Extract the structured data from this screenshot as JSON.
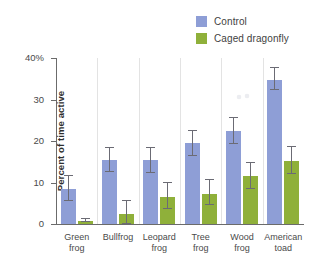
{
  "chart_data": {
    "type": "bar",
    "title": "",
    "xlabel": "",
    "ylabel": "Percent of time active",
    "ylim": [
      0,
      40
    ],
    "yticks": [
      0,
      10,
      20,
      30,
      40
    ],
    "ytick_labels": [
      "0",
      "10",
      "20",
      "30",
      "40%"
    ],
    "grid": false,
    "legend_position": "top-right",
    "categories": [
      "Green\nfrog",
      "Bullfrog",
      "Leopard\nfrog",
      "Tree\nfrog",
      "Wood\nfrog",
      "American\ntoad"
    ],
    "series": [
      {
        "name": "Control",
        "color": "#8e9ed6",
        "values": [
          8.5,
          15.4,
          15.4,
          19.5,
          22.5,
          34.6
        ],
        "errors_low": [
          3.0,
          2.9,
          3.0,
          3.0,
          3.1,
          2.2
        ],
        "errors_high": [
          3.0,
          2.9,
          3.0,
          3.0,
          3.1,
          2.9
        ]
      },
      {
        "name": "Caged dragonfly",
        "color": "#8fb03a",
        "values": [
          0.8,
          2.5,
          6.6,
          7.2,
          11.5,
          15.3
        ],
        "errors_low": [
          0.4,
          2.5,
          3.0,
          2.7,
          3.0,
          3.2
        ],
        "errors_high": [
          0.4,
          3.0,
          3.3,
          3.3,
          3.2,
          3.3
        ]
      }
    ],
    "annotations": [
      {
        "name": "scan-artifact",
        "x_px": 236,
        "y_px": 93
      }
    ]
  },
  "legend": {
    "items": [
      {
        "label": "Control",
        "color": "#8e9ed6"
      },
      {
        "label": "Caged dragonfly",
        "color": "#8fb03a"
      }
    ]
  }
}
